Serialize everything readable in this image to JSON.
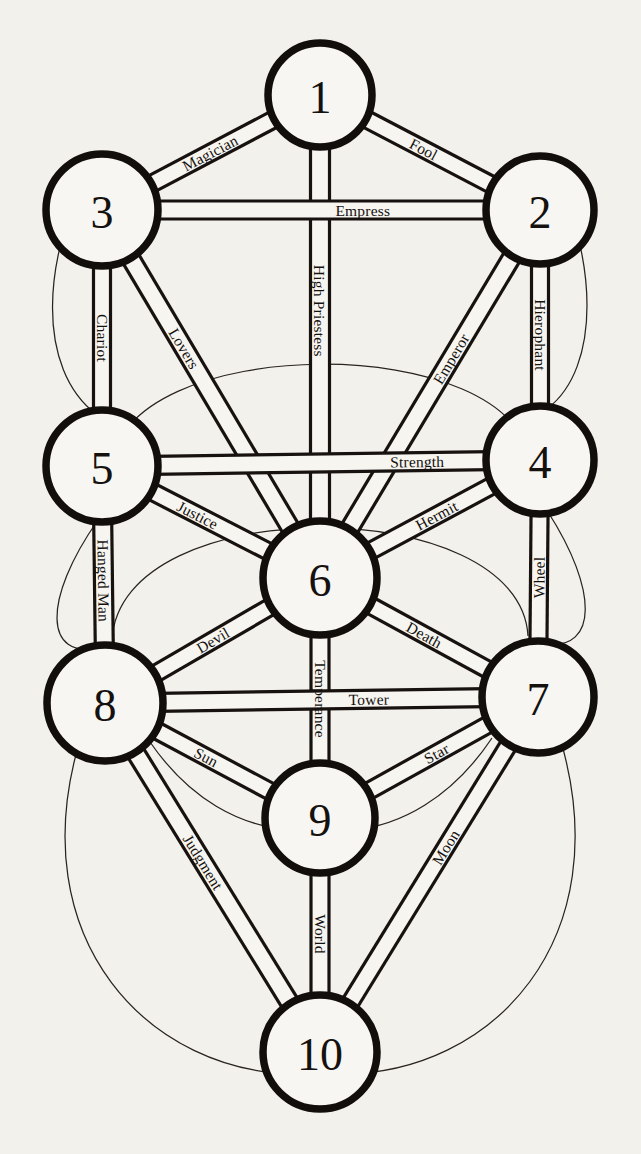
{
  "diagram": {
    "background_color": "#f3f1ec",
    "ink_color": "#14110f",
    "node_shape": "circle",
    "node_fill": "#f8f6f2"
  },
  "sephiroth": [
    {
      "id": "s1",
      "label": "1",
      "cx": 320,
      "cy": 95,
      "r": 52
    },
    {
      "id": "s2",
      "label": "2",
      "cx": 540,
      "cy": 210,
      "r": 54
    },
    {
      "id": "s3",
      "label": "3",
      "cx": 102,
      "cy": 210,
      "r": 56
    },
    {
      "id": "s4",
      "label": "4",
      "cx": 540,
      "cy": 460,
      "r": 54
    },
    {
      "id": "s5",
      "label": "5",
      "cx": 102,
      "cy": 466,
      "r": 56
    },
    {
      "id": "s6",
      "label": "6",
      "cx": 320,
      "cy": 578,
      "r": 57
    },
    {
      "id": "s7",
      "label": "7",
      "cx": 538,
      "cy": 697,
      "r": 56
    },
    {
      "id": "s8",
      "label": "8",
      "cx": 105,
      "cy": 703,
      "r": 58
    },
    {
      "id": "s9",
      "label": "9",
      "cx": 320,
      "cy": 818,
      "r": 55
    },
    {
      "id": "s10",
      "label": "10",
      "cx": 320,
      "cy": 1052,
      "r": 57
    }
  ],
  "paths": [
    {
      "id": "p-fool",
      "label": "Fool",
      "from": "s1",
      "to": "s2",
      "width": 17,
      "label_pos": 0.46,
      "flip": false
    },
    {
      "id": "p-magician",
      "label": "Magician",
      "from": "s1",
      "to": "s3",
      "width": 17,
      "label_pos": 0.52,
      "flip": true
    },
    {
      "id": "p-high-priestess",
      "label": "High Priestess",
      "from": "s1",
      "to": "s6",
      "width": 19,
      "label_pos": 0.44,
      "flip": false
    },
    {
      "id": "p-empress",
      "label": "Empress",
      "from": "s3",
      "to": "s2",
      "width": 18,
      "label_pos": 0.62,
      "flip": false
    },
    {
      "id": "p-emperor",
      "label": "Emperor",
      "from": "s2",
      "to": "s6",
      "width": 18,
      "label_pos": 0.38,
      "flip": true
    },
    {
      "id": "p-hierophant",
      "label": "Hierophant",
      "from": "s2",
      "to": "s4",
      "width": 17,
      "label_pos": 0.5,
      "flip": false
    },
    {
      "id": "p-chariot",
      "label": "Chariot",
      "from": "s3",
      "to": "s5",
      "width": 17,
      "label_pos": 0.5,
      "flip": true
    },
    {
      "id": "p-lovers",
      "label": "Lovers",
      "from": "s3",
      "to": "s6",
      "width": 18,
      "label_pos": 0.34,
      "flip": false
    },
    {
      "id": "p-strength",
      "label": "Strength",
      "from": "s5",
      "to": "s4",
      "width": 18,
      "label_pos": 0.78,
      "flip": false
    },
    {
      "id": "p-hermit",
      "label": "Hermit",
      "from": "s4",
      "to": "s6",
      "width": 17,
      "label_pos": 0.46,
      "flip": true
    },
    {
      "id": "p-wheel",
      "label": "Wheel",
      "from": "s4",
      "to": "s7",
      "width": 17,
      "label_pos": 0.5,
      "flip": false
    },
    {
      "id": "p-justice",
      "label": "Justice",
      "from": "s5",
      "to": "s6",
      "width": 17,
      "label_pos": 0.4,
      "flip": false
    },
    {
      "id": "p-hanged-man",
      "label": "Hanged Man",
      "from": "s5",
      "to": "s8",
      "width": 18,
      "label_pos": 0.48,
      "flip": true
    },
    {
      "id": "p-death",
      "label": "Death",
      "from": "s6",
      "to": "s7",
      "width": 17,
      "label_pos": 0.46,
      "flip": false
    },
    {
      "id": "p-temperance",
      "label": "Temperance",
      "from": "s6",
      "to": "s9",
      "width": 18,
      "label_pos": 0.5,
      "flip": true
    },
    {
      "id": "p-devil",
      "label": "Devil",
      "from": "s6",
      "to": "s8",
      "width": 17,
      "label_pos": 0.5,
      "flip": true
    },
    {
      "id": "p-tower",
      "label": "Tower",
      "from": "s8",
      "to": "s7",
      "width": 18,
      "label_pos": 0.64,
      "flip": false
    },
    {
      "id": "p-star",
      "label": "Star",
      "from": "s7",
      "to": "s9",
      "width": 17,
      "label_pos": 0.44,
      "flip": true
    },
    {
      "id": "p-moon",
      "label": "Moon",
      "from": "s7",
      "to": "s10",
      "width": 17,
      "label_pos": 0.4,
      "flip": true
    },
    {
      "id": "p-sun",
      "label": "Sun",
      "from": "s8",
      "to": "s9",
      "width": 17,
      "label_pos": 0.44,
      "flip": false
    },
    {
      "id": "p-judgment",
      "label": "Judgment",
      "from": "s8",
      "to": "s10",
      "width": 18,
      "label_pos": 0.44,
      "flip": false
    },
    {
      "id": "p-world",
      "label": "World",
      "from": "s9",
      "to": "s10",
      "width": 18,
      "label_pos": 0.5,
      "flip": true
    }
  ],
  "decorative_arcs": [
    {
      "id": "arc-left-upper",
      "d": "M 96 156 C 38 260, 38 370, 96 414"
    },
    {
      "id": "arc-left-lower",
      "d": "M 98 520 C 42 600, 44 660, 100 648"
    },
    {
      "id": "arc-right-upper",
      "d": "M 548 158 C 600 258, 600 368, 548 408"
    },
    {
      "id": "arc-right-lower",
      "d": "M 548 512 C 598 590, 598 650, 546 644"
    },
    {
      "id": "arc-middle-big",
      "d": "M 110 470 C 120 330, 520 330, 530 464"
    },
    {
      "id": "arc-middle-lower",
      "d": "M 112 640 C 120 490, 520 492, 528 636"
    },
    {
      "id": "arc-bottom-big",
      "d": "M 80 740 C 20 940, 150 1075, 300 1074"
    },
    {
      "id": "arc-bottom-big-r",
      "d": "M 560 738 C 620 940, 492 1074, 342 1074"
    },
    {
      "id": "arc-nine-left",
      "d": "M 150 742 C 190 800, 240 826, 290 830"
    },
    {
      "id": "arc-nine-right",
      "d": "M 492 738 C 452 798, 400 826, 352 830"
    }
  ]
}
